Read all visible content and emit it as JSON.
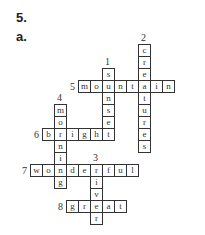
{
  "heading": {
    "number": "5.",
    "part": "a."
  },
  "grid": {
    "cell_size": 12,
    "origin_x": 78,
    "origin_y": 80,
    "words": [
      {
        "num": "1",
        "dir": "down",
        "answer": "sunset",
        "col": 2,
        "row": -1
      },
      {
        "num": "2",
        "dir": "down",
        "answer": "creatures",
        "col": 5,
        "row": -3
      },
      {
        "num": "3",
        "dir": "down",
        "answer": "river",
        "col": 1,
        "row": 7
      },
      {
        "num": "4",
        "dir": "down",
        "answer": "morning",
        "col": -2,
        "row": 2
      },
      {
        "num": "5",
        "dir": "across",
        "answer": "mountain",
        "col": 0,
        "row": 0
      },
      {
        "num": "6",
        "dir": "across",
        "answer": "bright",
        "col": -3,
        "row": 4
      },
      {
        "num": "7",
        "dir": "across",
        "answer": "wonderful",
        "col": -4,
        "row": 7
      },
      {
        "num": "8",
        "dir": "across",
        "answer": "great",
        "col": -1,
        "row": 10
      }
    ]
  }
}
